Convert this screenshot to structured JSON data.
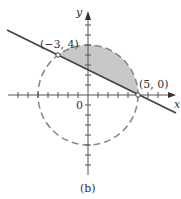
{
  "figure": {
    "caption": "(b)",
    "axes": {
      "x_label": "x",
      "y_label": "y",
      "origin_label": "0",
      "tick_spacing": 1,
      "x_range": [
        -8,
        8
      ],
      "y_range": [
        -8,
        8
      ]
    },
    "circle": {
      "center": [
        0,
        0
      ],
      "radius": 5,
      "style": "dashed",
      "color": "#8a8a8a"
    },
    "line": {
      "equation": "x + 2y = 5",
      "through": [
        [
          -3,
          4
        ],
        [
          5,
          0
        ]
      ],
      "color": "#444444"
    },
    "shaded_region": {
      "description": "region inside circle above the line",
      "color": "#c8c8c8"
    },
    "points": [
      {
        "label": "(−3, 4)",
        "coords": [
          -3,
          4
        ]
      },
      {
        "label": "(5, 0)",
        "coords": [
          5,
          0
        ]
      }
    ]
  }
}
